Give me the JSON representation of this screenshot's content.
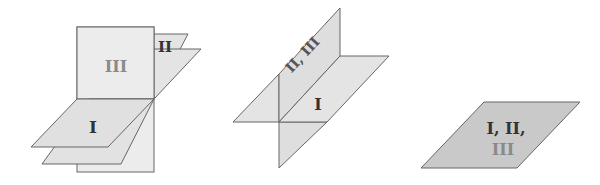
{
  "colors": {
    "stroke": "#666666",
    "plane_light": "#ececec",
    "plane_mid": "#e0e0e0",
    "plane_dark": "#c9c9c9",
    "label_dark": "#333333",
    "label_gray": "#8a8a8a"
  },
  "figures": [
    {
      "id": "intersecting-line",
      "labels": {
        "plane1": "I",
        "plane2": "II",
        "plane3": "III"
      }
    },
    {
      "id": "coincident-two",
      "labels": {
        "plane1": "I",
        "plane23": "II, III"
      }
    },
    {
      "id": "coincident-all",
      "labels": {
        "line1": "I, II,",
        "line2": "III"
      }
    }
  ]
}
